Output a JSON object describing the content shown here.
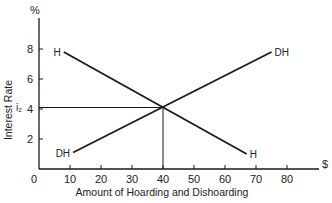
{
  "chart_data": {
    "type": "line",
    "title": "",
    "xlabel": "Amount of Hoarding and Dishoarding",
    "ylabel": "Interest Rate",
    "x_unit": "$",
    "y_unit": "%",
    "xlim": [
      0,
      85
    ],
    "ylim": [
      0,
      9
    ],
    "x_ticks": [
      0,
      10,
      20,
      30,
      40,
      50,
      60,
      70,
      80
    ],
    "y_ticks": [
      2,
      4,
      6,
      8
    ],
    "grid": false,
    "legend": "none (inline curve labels)",
    "series": [
      {
        "name": "H",
        "label_start": "H",
        "label_end": "H",
        "points": [
          [
            8,
            7.8
          ],
          [
            67,
            1.0
          ]
        ]
      },
      {
        "name": "DH",
        "label_start": "DH",
        "label_end": "DH",
        "points": [
          [
            11,
            1.1
          ],
          [
            75,
            7.8
          ]
        ]
      }
    ],
    "equilibrium": {
      "x": 40,
      "y": 4.1,
      "y_label": "i₂"
    },
    "annotations": [
      {
        "type": "hline",
        "y": 4.1,
        "from_x": 0,
        "to_x": 40
      },
      {
        "type": "vline",
        "x": 40,
        "from_y": 0,
        "to_y": 4.1
      }
    ]
  },
  "labels": {
    "y_unit": "%",
    "x_unit": "$",
    "y_title": "Interest Rate",
    "x_title": "Amount of Hoarding and Dishoarding",
    "eq_rate": "i₂",
    "origin": "0"
  }
}
